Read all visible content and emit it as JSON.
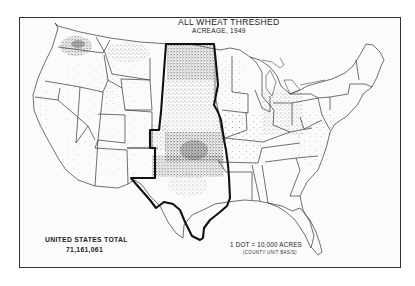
{
  "map": {
    "title": "ALL WHEAT THRESHED",
    "subtitle": "ACREAGE, 1949",
    "total": {
      "label": "UNITED STATES TOTAL",
      "value": "71,161,061"
    },
    "legend": {
      "dot_value": "1 DOT = 10,000 ACRES",
      "basis": "(COUNTY UNIT BASIS)"
    },
    "highlighted_region": "Great Plains wheat belt (ND, SD, NE, KS, OK, TX)",
    "colors": {
      "ink": "#222222",
      "paper": "#ffffff"
    }
  }
}
